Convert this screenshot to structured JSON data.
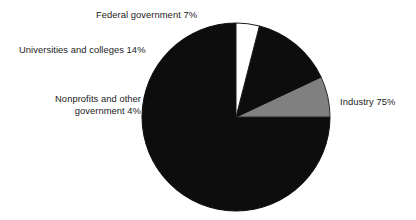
{
  "chart_data": {
    "type": "pie",
    "title": "",
    "subtitle": "",
    "xlabel": "",
    "ylabel": "",
    "legend_position": "none",
    "grid": false,
    "start_angle_deg": 90,
    "direction": "counterclockwise",
    "categories": [
      "Industry",
      "Federal government",
      "Universities and colleges",
      "Nonprofits and other government"
    ],
    "values": [
      75,
      7,
      14,
      4
    ],
    "units": "percent",
    "slices": [
      {
        "name": "Industry",
        "value": 75,
        "value_text": "75%",
        "label": "Industry 75%",
        "color": "#0d0d0d",
        "edge_color": "#0d0d0d",
        "label_position": "right"
      },
      {
        "name": "Federal government",
        "value": 7,
        "value_text": "7%",
        "label": "Federal government 7%",
        "color": "#808080",
        "edge_color": "#2a2a2a",
        "label_position": "top"
      },
      {
        "name": "Universities and colleges",
        "value": 14,
        "value_text": "14%",
        "label": "Universities and colleges 14%",
        "color": "#0d0d0d",
        "edge_color": "#0d0d0d",
        "label_position": "upper-left"
      },
      {
        "name": "Nonprofits and other government",
        "value": 4,
        "value_text": "4%",
        "label_line1": "Nonprofits and other",
        "label_line2": "government 4%",
        "label": "Nonprofits and other government 4%",
        "color": "#ffffff",
        "edge_color": "#1a1a1a",
        "label_position": "left"
      }
    ]
  },
  "figure": {
    "background_color": "#ffffff",
    "text_color": "#1b1b1b",
    "center_x": 236,
    "center_y": 117,
    "radius": 94
  },
  "labels": {
    "industry": "Industry 75%",
    "federal_government": "Federal government 7%",
    "universities_and_colleges": "Universities and colleges 14%",
    "nonprofits_line1": "Nonprofits and other",
    "nonprofits_line2": "government 4%"
  }
}
